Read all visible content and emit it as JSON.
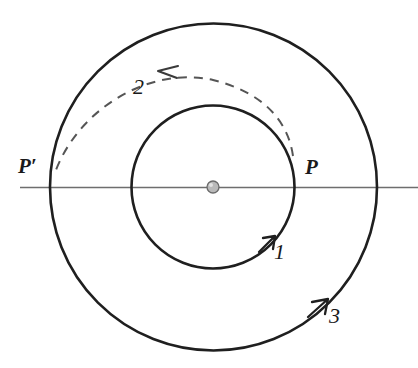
{
  "figure": {
    "background_color": "#ffffff",
    "stroke_color": "#1f1f1f",
    "axis_color": "#6e6e6e",
    "dash_color": "#555555",
    "center_dot_fill": "#b9b9b9"
  },
  "labels": {
    "point_p_prime": "P′",
    "point_p": "P",
    "orbit_1": "1",
    "transfer_2": "2",
    "orbit_3": "3"
  },
  "geometry": {
    "center": {
      "x": 213,
      "y": 187
    },
    "inner_circle_radius": 82,
    "outer_circle_radius": 164,
    "center_dot_radius": 6,
    "axis_line": {
      "x1": 20,
      "y1": 187,
      "x2": 418,
      "y2": 187
    },
    "point_p": {
      "x": 295,
      "y": 187
    },
    "point_p_prime": {
      "x": 51,
      "y": 187
    }
  },
  "elements": [
    {
      "name": "inner-orbit",
      "kind": "circle",
      "label": "1",
      "style": "solid",
      "direction": "counterclockwise"
    },
    {
      "name": "transfer-arc",
      "kind": "arc",
      "label": "2",
      "style": "dashed",
      "direction": "leftward"
    },
    {
      "name": "outer-orbit",
      "kind": "circle",
      "label": "3",
      "style": "solid",
      "direction": "counterclockwise"
    },
    {
      "name": "apsidal-line",
      "kind": "line",
      "label": "",
      "style": "solid",
      "direction": "horizontal"
    },
    {
      "name": "central-body",
      "kind": "dot",
      "label": "",
      "style": "filled",
      "direction": ""
    }
  ]
}
